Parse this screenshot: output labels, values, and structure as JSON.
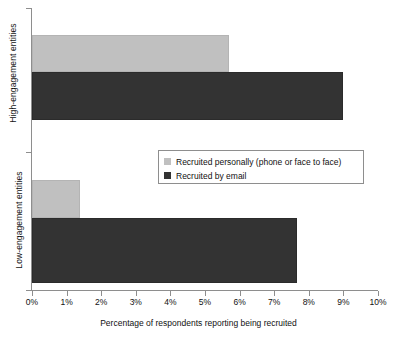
{
  "chart_data": {
    "type": "bar",
    "orientation": "horizontal",
    "title": "",
    "xlabel": "Percentage of respondents reporting being recruited",
    "ylabel": "",
    "categories": [
      "High-engagement entities",
      "Low-engagement entities"
    ],
    "series": [
      {
        "name": "Recruited personally (phone or face to face)",
        "color": "#c0c0c0",
        "values": [
          5.7,
          1.4
        ]
      },
      {
        "name": "Recruited by email",
        "color": "#333333",
        "values": [
          9.0,
          7.65
        ]
      }
    ],
    "xlim": [
      0,
      10
    ],
    "xticks": [
      0,
      1,
      2,
      3,
      4,
      5,
      6,
      7,
      8,
      9,
      10
    ],
    "xtick_labels": [
      "0%",
      "1%",
      "2%",
      "3%",
      "4%",
      "5%",
      "6%",
      "7%",
      "8%",
      "9%",
      "10%"
    ],
    "grid": false,
    "legend_position": "center"
  },
  "axes": {
    "y_categories": [
      {
        "label": "High-engagement entities"
      },
      {
        "label": "Low-engagement entities"
      }
    ],
    "x_title": "Percentage of respondents reporting being recruited",
    "x_ticks": [
      {
        "label": "0%",
        "value": 0
      },
      {
        "label": "1%",
        "value": 1
      },
      {
        "label": "2%",
        "value": 2
      },
      {
        "label": "3%",
        "value": 3
      },
      {
        "label": "4%",
        "value": 4
      },
      {
        "label": "5%",
        "value": 5
      },
      {
        "label": "6%",
        "value": 6
      },
      {
        "label": "7%",
        "value": 7
      },
      {
        "label": "8%",
        "value": 8
      },
      {
        "label": "9%",
        "value": 9
      },
      {
        "label": "10%",
        "value": 10
      }
    ]
  },
  "legend": {
    "entries": [
      {
        "label": "Recruited personally (phone or face to face)",
        "color": "#c0c0c0"
      },
      {
        "label": "Recruited by email",
        "color": "#333333"
      }
    ]
  },
  "colors": {
    "personal": "#c0c0c0",
    "email": "#333333",
    "axis": "#8e8e8e",
    "text": "#111111",
    "background": "#ffffff"
  }
}
